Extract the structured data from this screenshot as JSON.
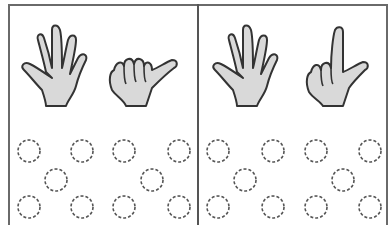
{
  "worksheet": {
    "panels": [
      {
        "id": "left",
        "hands": [
          {
            "name": "open-hand-icon",
            "fingers": 5
          },
          {
            "name": "thumb-hand-icon",
            "fingers": 1
          }
        ],
        "dot_count": 10
      },
      {
        "id": "right",
        "hands": [
          {
            "name": "open-hand-icon",
            "fingers": 5
          },
          {
            "name": "index-thumb-hand-icon",
            "fingers": 2
          }
        ],
        "dot_count": 10
      }
    ],
    "colors": {
      "hand_fill": "#d9d9d9",
      "outline": "#333333",
      "border": "#6a6a6a",
      "dashed_circle": "#555555"
    }
  }
}
